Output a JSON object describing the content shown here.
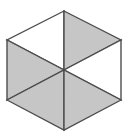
{
  "figure": {
    "name": "hexagon-six-triangles",
    "background_color": "#ffffff",
    "fill_gray": "#c6c6c6",
    "fill_white": "#ffffff",
    "stroke_color": "#4d4d4d",
    "stroke_width": 1.4,
    "canvas": {
      "width": 129,
      "height": 140
    },
    "center": {
      "x": 64,
      "y": 70
    },
    "vertices": [
      {
        "name": "top",
        "x": 64,
        "y": 11
      },
      {
        "name": "upper-right",
        "x": 121,
        "y": 40
      },
      {
        "name": "lower-right",
        "x": 121,
        "y": 100
      },
      {
        "name": "bottom",
        "x": 64,
        "y": 130
      },
      {
        "name": "lower-left",
        "x": 7,
        "y": 100
      },
      {
        "name": "upper-left",
        "x": 7,
        "y": 40
      }
    ],
    "triangles": [
      {
        "name": "triangle-top-left",
        "fill": "white",
        "points": "64,11 7,40 64,70"
      },
      {
        "name": "triangle-top-right",
        "fill": "gray",
        "points": "64,11 121,40 64,70"
      },
      {
        "name": "triangle-left",
        "fill": "gray",
        "points": "7,40 7,100 64,70"
      },
      {
        "name": "triangle-right",
        "fill": "white",
        "points": "121,40 121,100 64,70"
      },
      {
        "name": "triangle-bottom-left",
        "fill": "gray",
        "points": "7,100 64,130 64,70"
      },
      {
        "name": "triangle-bottom-right",
        "fill": "gray",
        "points": "121,100 64,130 64,70"
      }
    ]
  }
}
